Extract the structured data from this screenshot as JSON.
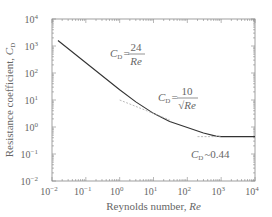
{
  "chart_data": {
    "type": "line",
    "title": "",
    "xlabel": "Reynolds number, Re",
    "xlabel_text": "Reynolds number, ",
    "xlabel_var": "Re",
    "ylabel": "Resistance coefficient, C_D",
    "ylabel_text": "Resistance coefficient, ",
    "ylabel_var": "C",
    "ylabel_sub": "D",
    "xscale": "log",
    "yscale": "log",
    "xlim": [
      0.01,
      10000
    ],
    "ylim": [
      0.01,
      10000
    ],
    "x_ticks": [
      "10^-2",
      "10^-1",
      "10^0",
      "10^1",
      "10^2",
      "10^3",
      "10^4"
    ],
    "y_ticks": [
      "10^-2",
      "10^-1",
      "10^0",
      "10^1",
      "10^2",
      "10^3",
      "10^4"
    ],
    "grid": false,
    "legend": null,
    "series": [
      {
        "name": "C_D curve",
        "style": "solid",
        "x": [
          0.015,
          0.1,
          1,
          3,
          10,
          30,
          100,
          300,
          700,
          1000,
          3000,
          10000
        ],
        "y": [
          1600,
          240,
          24,
          8.5,
          3.2,
          1.6,
          0.95,
          0.6,
          0.46,
          0.44,
          0.44,
          0.44
        ]
      },
      {
        "name": "C_D = 10/sqrt(Re) asymptote",
        "style": "dashed",
        "x": [
          1,
          30
        ],
        "y": [
          10,
          1.83
        ]
      },
      {
        "name": "C_D ~ 0.44 asymptote",
        "style": "dashed",
        "x": [
          200,
          1000
        ],
        "y": [
          0.44,
          0.44
        ]
      }
    ],
    "annotations": [
      {
        "text": "C_D = 24/Re",
        "label": "C",
        "sub": "D",
        "eq": "=",
        "num": "24",
        "den": "Re",
        "x": 5,
        "y": 500
      },
      {
        "text": "C_D = 10/√Re",
        "label": "C",
        "sub": "D",
        "eq": "=",
        "num": "10",
        "den": "√Re",
        "x": 200,
        "y": 3
      },
      {
        "text": "C_D ~ 0.44",
        "label": "C",
        "sub": "D",
        "rest": "~0.44",
        "x": 1000,
        "y": 0.12
      }
    ],
    "colors": {
      "curve": "#333333",
      "dashed": "#aaaaaa",
      "axis": "#888888",
      "text": "#666666"
    }
  },
  "tick_labels": {
    "x": [
      {
        "base": "10",
        "exp": "−2"
      },
      {
        "base": "10",
        "exp": "−1"
      },
      {
        "base": "10",
        "exp": "0"
      },
      {
        "base": "10",
        "exp": "1"
      },
      {
        "base": "10",
        "exp": "2"
      },
      {
        "base": "10",
        "exp": "3"
      },
      {
        "base": "10",
        "exp": "4"
      }
    ],
    "y": [
      {
        "base": "10",
        "exp": "−2"
      },
      {
        "base": "10",
        "exp": "−1"
      },
      {
        "base": "10",
        "exp": "0"
      },
      {
        "base": "10",
        "exp": "1"
      },
      {
        "base": "10",
        "exp": "2"
      },
      {
        "base": "10",
        "exp": "3"
      },
      {
        "base": "10",
        "exp": "4"
      }
    ]
  }
}
